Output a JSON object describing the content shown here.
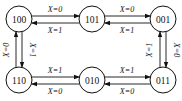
{
  "diagram": {
    "type": "state-transition",
    "states": [
      {
        "id": "100",
        "label": "100",
        "x": 19,
        "y": 19
      },
      {
        "id": "101",
        "label": "101",
        "x": 92,
        "y": 19
      },
      {
        "id": "001",
        "label": "001",
        "x": 163,
        "y": 19
      },
      {
        "id": "110",
        "label": "110",
        "x": 19,
        "y": 80
      },
      {
        "id": "010",
        "label": "010",
        "x": 92,
        "y": 80
      },
      {
        "id": "011",
        "label": "011",
        "x": 163,
        "y": 80
      }
    ],
    "transitions": [
      {
        "from": "100",
        "to": "101",
        "label": "X=0"
      },
      {
        "from": "101",
        "to": "100",
        "label": "X=1"
      },
      {
        "from": "101",
        "to": "001",
        "label": "X=0"
      },
      {
        "from": "001",
        "to": "101",
        "label": "X=1"
      },
      {
        "from": "110",
        "to": "010",
        "label": "X=1"
      },
      {
        "from": "010",
        "to": "110",
        "label": "X=0"
      },
      {
        "from": "010",
        "to": "011",
        "label": "X=1"
      },
      {
        "from": "011",
        "to": "010",
        "label": "X=0"
      },
      {
        "from": "110",
        "to": "100",
        "label": "X=0"
      },
      {
        "from": "100",
        "to": "110",
        "label": "X=1"
      },
      {
        "from": "011",
        "to": "001",
        "label": "X=1"
      },
      {
        "from": "001",
        "to": "011",
        "label": "X=0"
      }
    ]
  }
}
